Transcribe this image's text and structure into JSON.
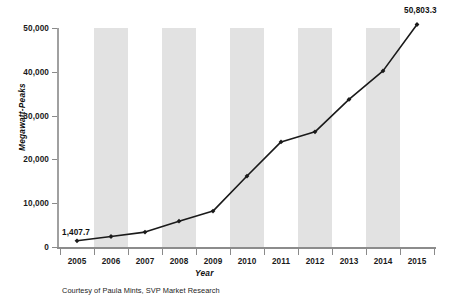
{
  "chart_data": {
    "type": "line",
    "title": "",
    "subtitle": "",
    "xlabel": "Year",
    "ylabel": "Megawatt-Peaks",
    "categories": [
      "2005",
      "2006",
      "2007",
      "2008",
      "2009",
      "2010",
      "2011",
      "2012",
      "2013",
      "2014",
      "2015"
    ],
    "values": [
      1407.7,
      2400,
      3400,
      5900,
      8200,
      16200,
      24000,
      26300,
      33700,
      40200,
      50803.3
    ],
    "series": [
      {
        "name": "Megawatt-Peaks",
        "values": [
          1407.7,
          2400,
          3400,
          5900,
          8200,
          16200,
          24000,
          26300,
          33700,
          40200,
          50803.3
        ]
      }
    ],
    "ylim": [
      0,
      50000
    ],
    "ytick_values": [
      0,
      10000,
      20000,
      30000,
      40000,
      50000
    ],
    "ytick_labels": [
      "0",
      "10,000",
      "20,000",
      "30,000",
      "40,000",
      "50,000"
    ],
    "grid": false,
    "legend_position": "none",
    "banding": "alternating vertical gray bands behind every other category",
    "marker": "filled diamond",
    "line_color": "#1a1a1a",
    "band_color": "#e2e2e2",
    "annotations": [
      {
        "label": "1,407.7",
        "category": "2005",
        "value": 1407.7
      },
      {
        "label": "50,803.3",
        "category": "2015",
        "value": 50803.3
      }
    ]
  },
  "labels": {
    "first_point": "1,407.7",
    "last_point": "50,803.3"
  },
  "footer": {
    "credit": "Courtesy of Paula Mints, SVP Market Research"
  }
}
